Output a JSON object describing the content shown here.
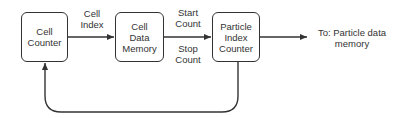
{
  "diagram": {
    "nodes": [
      {
        "id": "cell-counter",
        "lines": [
          "Cell",
          "Counter"
        ]
      },
      {
        "id": "cell-data-memory",
        "lines": [
          "Cell",
          "Data",
          "Memory"
        ]
      },
      {
        "id": "particle-index-counter",
        "lines": [
          "Particle",
          "Index",
          "Counter"
        ]
      }
    ],
    "edges": [
      {
        "from": "cell-counter",
        "to": "cell-data-memory",
        "label": [
          "Cell",
          "Index"
        ]
      },
      {
        "from": "cell-data-memory",
        "to": "particle-index-counter",
        "label_top": [
          "Start",
          "Count"
        ],
        "label_bottom": [
          "Stop",
          "Count"
        ]
      },
      {
        "from": "particle-index-counter",
        "to": "output",
        "label": [
          "To: Particle data",
          "memory"
        ]
      },
      {
        "from": "particle-index-counter",
        "to": "cell-counter",
        "label": ""
      }
    ],
    "colors": {
      "stroke": "#333333",
      "text": "#333333",
      "background": "#ffffff"
    }
  }
}
